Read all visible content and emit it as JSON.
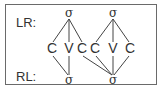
{
  "diagram": {
    "labels": {
      "lr": "LR:",
      "rl": "RL:"
    },
    "top_nodes": [
      {
        "id": "s1",
        "label": "σ",
        "x": 69,
        "y": 17
      },
      {
        "id": "s2",
        "label": "σ",
        "x": 113,
        "y": 17
      }
    ],
    "segments": [
      {
        "id": "c1",
        "label": "C",
        "x": 52,
        "y": 53
      },
      {
        "id": "v1",
        "label": "V",
        "x": 69,
        "y": 53
      },
      {
        "id": "c2",
        "label": "C",
        "x": 82,
        "y": 53
      },
      {
        "id": "c3",
        "label": "C",
        "x": 95,
        "y": 53
      },
      {
        "id": "v2",
        "label": "V",
        "x": 113,
        "y": 53
      },
      {
        "id": "c4",
        "label": "C",
        "x": 130,
        "y": 53
      }
    ],
    "bottom_nodes": [
      {
        "id": "b1",
        "label": "σ",
        "x": 69,
        "y": 84
      },
      {
        "id": "b2",
        "label": "σ",
        "x": 113,
        "y": 84
      }
    ]
  }
}
